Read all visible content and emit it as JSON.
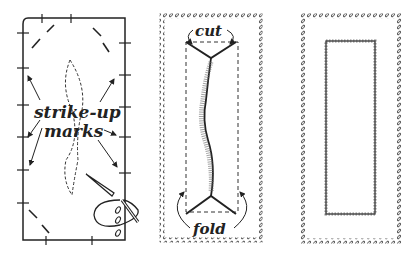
{
  "diagram": {
    "panels": [
      {
        "id": "panel-1",
        "description": "Fabric rectangle with strike-up marks, dashed stitching line and needle with thread",
        "labels": [
          "strike-up",
          "marks"
        ]
      },
      {
        "id": "panel-2",
        "description": "Bound edge with slash cut down center, dashed fold lines",
        "labels": [
          "cut",
          "fold"
        ]
      },
      {
        "id": "panel-3",
        "description": "Finished bound opening with decorative stitched border",
        "labels": []
      }
    ],
    "label_strike": "strike-up",
    "label_marks": "marks",
    "label_cut": "cut",
    "label_fold": "fold",
    "colors": {
      "ink": "#222222",
      "background": "#ffffff"
    }
  }
}
